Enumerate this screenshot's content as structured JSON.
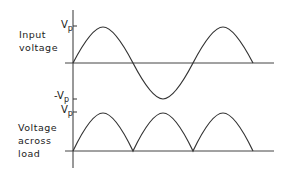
{
  "diagram": {
    "panels": [
      {
        "name": "input",
        "label_lines": [
          "Input",
          "voltage"
        ],
        "ticks": [
          {
            "main": "V",
            "sub": "p"
          },
          {
            "main": "-V",
            "sub": "p"
          }
        ],
        "waveform": "sine"
      },
      {
        "name": "load",
        "label_lines": [
          "Voltage",
          "across",
          "load"
        ],
        "ticks": [
          {
            "main": "V",
            "sub": "p"
          }
        ],
        "waveform": "full-wave-rectified"
      }
    ],
    "colors": {
      "stroke": "#333333",
      "background": "#ffffff"
    }
  }
}
